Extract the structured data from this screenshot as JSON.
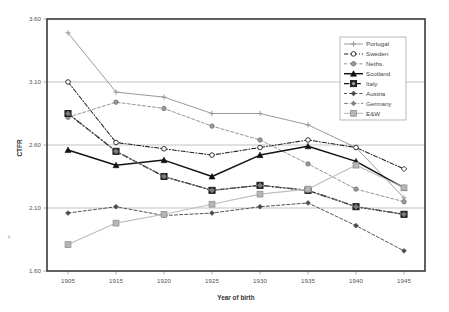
{
  "chart_data": {
    "type": "line",
    "title": "",
    "xlabel": "Year of birth",
    "ylabel": "CTFR",
    "categories": [
      "1905",
      "1915",
      "1920",
      "1925",
      "1930",
      "1935",
      "1940",
      "1945"
    ],
    "x_tick_labels": [
      "1905",
      "1915",
      "1920",
      "1925",
      "1930",
      "1935",
      "1940",
      "1945"
    ],
    "y_tick_labels": [
      "3.60",
      "3.10",
      "2.60",
      "2.10",
      "1.60"
    ],
    "y_tick_values": [
      3.6,
      3.1,
      2.6,
      2.1,
      1.6
    ],
    "ylim": [
      1.6,
      3.6
    ],
    "grid": "horizontal",
    "legend_position": "top-right",
    "series": [
      {
        "name": "Portugal",
        "color": "#8c8c8c",
        "dash": "none",
        "marker": "plus",
        "values": [
          3.49,
          3.02,
          2.98,
          2.85,
          2.85,
          2.76,
          2.58,
          2.18
        ]
      },
      {
        "name": "Sweden",
        "color": "#2a2a2a",
        "dash": "dashdot",
        "marker": "open-circle",
        "values": [
          3.1,
          2.62,
          2.57,
          2.52,
          2.58,
          2.64,
          2.58,
          2.41
        ]
      },
      {
        "name": "Neths.",
        "color": "#8c8c8c",
        "dash": "dashed",
        "marker": "filled-circle",
        "values": [
          2.82,
          2.94,
          2.89,
          2.75,
          2.64,
          2.45,
          2.25,
          2.15
        ]
      },
      {
        "name": "Scotland",
        "color": "#1a1a1a",
        "dash": "none",
        "marker": "filled-triangle",
        "values": [
          2.56,
          2.44,
          2.48,
          2.35,
          2.52,
          2.59,
          2.47,
          2.26
        ]
      },
      {
        "name": "Italy",
        "color": "#1a1a1a",
        "dash": "dashdot",
        "marker": "filled-square",
        "values": [
          2.85,
          2.55,
          2.35,
          2.24,
          2.28,
          2.24,
          2.11,
          2.05
        ]
      },
      {
        "name": "Austria",
        "color": "#3a3a3a",
        "dash": "dashed",
        "marker": "small-diamond",
        "values": [
          2.06,
          2.11,
          2.04,
          2.06,
          2.11,
          2.14,
          1.96,
          1.76
        ]
      },
      {
        "name": "Germany",
        "color": "#7a7a7a",
        "dash": "dashdot",
        "marker": "small-diamond",
        "values": [
          2.85,
          2.55,
          2.35,
          2.24,
          2.28,
          2.24,
          2.11,
          2.05
        ]
      },
      {
        "name": "E&W",
        "color": "#b0b0b0",
        "dash": "none",
        "marker": "filled-square",
        "values": [
          1.81,
          1.98,
          2.05,
          2.13,
          2.21,
          2.25,
          2.44,
          2.26
        ]
      }
    ],
    "legend_entries": [
      "Portugal",
      "Sweden",
      "Neths.",
      "Scotland",
      "Italy",
      "Austria",
      "Germany",
      "E&W"
    ]
  }
}
